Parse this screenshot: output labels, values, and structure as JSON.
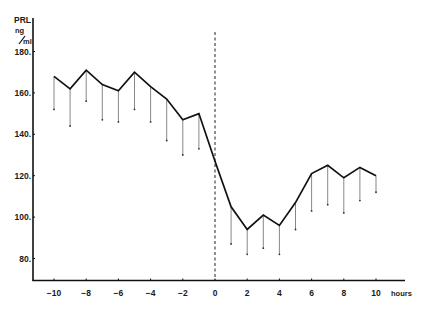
{
  "chart_data": {
    "type": "line",
    "title": "",
    "ylabel": "PRL ng/ml",
    "ylabel_lines": [
      "PRL",
      "ng",
      "ml"
    ],
    "xlabel": "hours",
    "ylim": [
      70,
      185
    ],
    "xlim": [
      -11.5,
      12
    ],
    "yticks": [
      80,
      100,
      120,
      140,
      160,
      180
    ],
    "xticks": [
      -10,
      -8,
      -6,
      -4,
      -2,
      0,
      2,
      4,
      6,
      8,
      10
    ],
    "grid": false,
    "legend": null,
    "annotations": [
      {
        "type": "dashed-vline",
        "x": 0
      }
    ],
    "x": [
      -10,
      -9,
      -8,
      -7,
      -6,
      -5,
      -4,
      -3,
      -2,
      -1,
      0,
      1,
      2,
      3,
      4,
      5,
      6,
      7,
      8,
      9,
      10
    ],
    "series": [
      {
        "name": "PRL mean",
        "values": [
          168,
          162,
          171,
          164,
          161,
          170,
          163,
          157,
          147,
          150,
          127,
          105,
          94,
          101,
          96,
          107,
          121,
          125,
          119,
          124,
          120
        ]
      },
      {
        "name": "PRL lower error (mean - SE)",
        "values": [
          152,
          144,
          156,
          147,
          146,
          152,
          146,
          137,
          130,
          133,
          null,
          87,
          82,
          85,
          82,
          94,
          103,
          106,
          102,
          108,
          112
        ]
      }
    ]
  }
}
